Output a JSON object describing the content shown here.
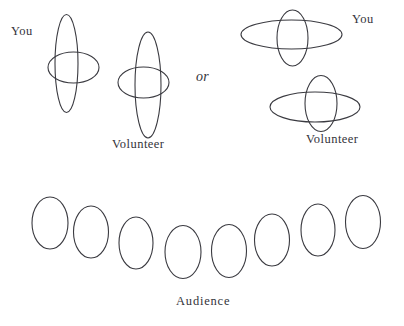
{
  "figure": {
    "background_color": "#ffffff",
    "stroke_color": "#3a3a40",
    "stroke_width": 1.1,
    "labels": {
      "you_left": "You",
      "volunteer_left": "Volunteer",
      "or": "or",
      "you_right": "You",
      "volunteer_right": "Volunteer",
      "audience": "Audience"
    },
    "option_left": {
      "name": "option-a-side-by-side",
      "shapes": [
        {
          "name": "you-left-chair-back",
          "type": "ellipse",
          "cx": 66.5,
          "cy": 63.5,
          "rx": 11.5,
          "ry": 49.0
        },
        {
          "name": "you-left-chair-seat",
          "type": "ellipse",
          "cx": 73.5,
          "cy": 67.5,
          "rx": 25.5,
          "ry": 15.5
        },
        {
          "name": "volunteer-left-chair-back",
          "type": "ellipse",
          "cx": 148.0,
          "cy": 85.0,
          "rx": 13.0,
          "ry": 53.0
        },
        {
          "name": "volunteer-left-chair-seat",
          "type": "ellipse",
          "cx": 143.5,
          "cy": 82.5,
          "rx": 25.5,
          "ry": 15.5
        }
      ]
    },
    "option_right": {
      "name": "option-b-stacked",
      "shapes": [
        {
          "name": "you-right-chair-seat",
          "type": "ellipse",
          "cx": 291.5,
          "cy": 34.5,
          "rx": 50.5,
          "ry": 14.5
        },
        {
          "name": "you-right-chair-back",
          "type": "ellipse",
          "cx": 292.5,
          "cy": 38.0,
          "rx": 15.5,
          "ry": 28.0
        },
        {
          "name": "volunteer-right-chair-seat",
          "type": "ellipse",
          "cx": 315.0,
          "cy": 107.0,
          "rx": 45.0,
          "ry": 15.0
        },
        {
          "name": "volunteer-right-chair-back",
          "type": "ellipse",
          "cx": 321.0,
          "cy": 103.5,
          "rx": 16.0,
          "ry": 28.0
        }
      ]
    },
    "audience": {
      "count": 8,
      "shapes": [
        {
          "name": "audience-seat-1",
          "type": "ellipse",
          "cx": 50.0,
          "cy": 223.0,
          "rx": 18.0,
          "ry": 26.0
        },
        {
          "name": "audience-seat-2",
          "type": "ellipse",
          "cx": 91.0,
          "cy": 232.0,
          "rx": 17.5,
          "ry": 26.0
        },
        {
          "name": "audience-seat-3",
          "type": "ellipse",
          "cx": 136.0,
          "cy": 243.0,
          "rx": 17.0,
          "ry": 26.0
        },
        {
          "name": "audience-seat-4",
          "type": "ellipse",
          "cx": 183.0,
          "cy": 252.0,
          "rx": 18.0,
          "ry": 26.5
        },
        {
          "name": "audience-seat-5",
          "type": "ellipse",
          "cx": 229.0,
          "cy": 251.0,
          "rx": 17.5,
          "ry": 26.5
        },
        {
          "name": "audience-seat-6",
          "type": "ellipse",
          "cx": 272.0,
          "cy": 240.0,
          "rx": 17.5,
          "ry": 26.0
        },
        {
          "name": "audience-seat-7",
          "type": "ellipse",
          "cx": 318.0,
          "cy": 230.0,
          "rx": 17.0,
          "ry": 26.0
        },
        {
          "name": "audience-seat-8",
          "type": "ellipse",
          "cx": 363.0,
          "cy": 222.0,
          "rx": 17.5,
          "ry": 26.5
        }
      ]
    }
  }
}
